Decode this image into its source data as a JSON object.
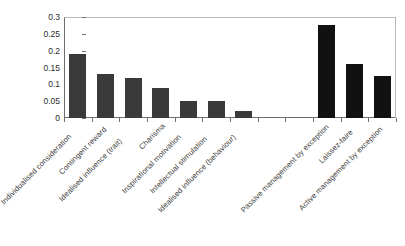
{
  "chart_data": {
    "type": "bar",
    "title": "",
    "subtitle": "",
    "xlabel": "",
    "ylabel": "",
    "ylim": [
      0,
      0.3
    ],
    "grid": false,
    "legend": "none",
    "y_ticks": [
      "0",
      "0.05",
      "0.1",
      "0.15",
      "0.2",
      "0.25",
      "0.3"
    ],
    "y_tick_values": [
      0,
      0.05,
      0.1,
      0.15,
      0.2,
      0.25,
      0.3
    ],
    "categories": [
      "Individualised consideration",
      "Contingent reward",
      "Idealised influence (trait)",
      "Charisma",
      "Inspirational motivation",
      "Intellectual stimulation",
      "Idealised influence (behaviour)",
      "",
      "",
      "Passive management by exception",
      "Laissez-faire",
      "Active management by exception"
    ],
    "values": [
      0.19,
      0.13,
      0.12,
      0.09,
      0.05,
      0.05,
      0.02,
      0,
      0,
      0.275,
      0.16,
      0.125
    ],
    "bar_colors": [
      "#3a3a3a",
      "#3a3a3a",
      "#3a3a3a",
      "#3a3a3a",
      "#3a3a3a",
      "#3a3a3a",
      "#3a3a3a",
      "#3a3a3a",
      "#3a3a3a",
      "#111111",
      "#111111",
      "#111111"
    ],
    "axis_color": "#6e6e6e",
    "frame_color": "#b9b9b9",
    "background": "#ffffff"
  },
  "caption": {
    "text": ""
  }
}
